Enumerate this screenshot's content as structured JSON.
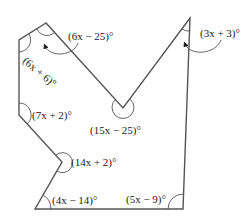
{
  "diagram": {
    "type": "concave octagon with labeled interior angles",
    "stroke_color": "#555555",
    "vertices": [
      {
        "name": "top-left",
        "x": 46,
        "y": 23,
        "angle": "(6x − 25)°"
      },
      {
        "name": "left-upper",
        "x": 19,
        "y": 40,
        "angle": "(6x + 6)°"
      },
      {
        "name": "left-lower",
        "x": 19,
        "y": 115,
        "angle": "(7x + 2)°"
      },
      {
        "name": "notch",
        "x": 62,
        "y": 162,
        "angle": "(14x + 2)°"
      },
      {
        "name": "bottom-left",
        "x": 35,
        "y": 209,
        "angle": "(4x − 14)°"
      },
      {
        "name": "bottom-right",
        "x": 183,
        "y": 209,
        "angle": "(5x − 9)°"
      },
      {
        "name": "top-right",
        "x": 190,
        "y": 18,
        "angle": "(3x + 3)°"
      },
      {
        "name": "valley",
        "x": 123,
        "y": 108,
        "angle": "(15x − 25)°"
      }
    ],
    "labels": {
      "top_left": "(6x − 25)°",
      "left_upper": "(6x + 6)°",
      "left_lower": "(7x + 2)°",
      "notch": "(14x + 2)°",
      "bottom_left": "(4x − 14)°",
      "bottom_right": "(5x − 9)°",
      "top_right": "(3x + 3)°",
      "valley": "(15x − 25)°"
    }
  }
}
